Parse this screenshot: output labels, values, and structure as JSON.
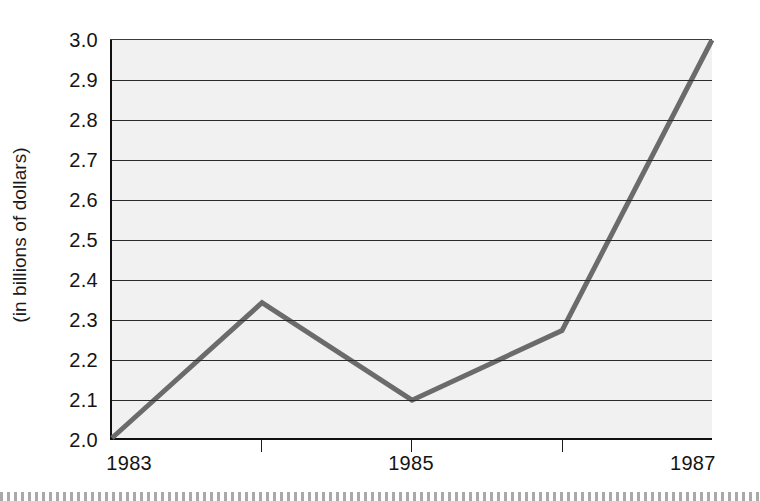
{
  "chart_data": {
    "type": "line",
    "title": "",
    "subtitle": "",
    "xlabel": "",
    "ylabel": "(in billions of dollars)",
    "x": [
      1983,
      1984,
      1985,
      1986,
      1987
    ],
    "values": [
      2.0,
      2.34,
      2.095,
      2.27,
      3.0
    ],
    "series": [
      {
        "name": "",
        "values": [
          2.0,
          2.34,
          2.095,
          2.27,
          3.0
        ]
      }
    ],
    "xlim": [
      1983,
      1987
    ],
    "ylim": [
      2.0,
      3.0
    ],
    "y_ticks": [
      "3.0",
      "2.9",
      "2.8",
      "2.7",
      "2.6",
      "2.5",
      "2.4",
      "2.3",
      "2.2",
      "2.1",
      "2.0"
    ],
    "y_tick_values": [
      3.0,
      2.9,
      2.8,
      2.7,
      2.6,
      2.5,
      2.4,
      2.3,
      2.2,
      2.1,
      2.0
    ],
    "x_ticks": [
      {
        "value": 1983,
        "label": "1983"
      },
      {
        "value": 1984,
        "label": ""
      },
      {
        "value": 1985,
        "label": "1985"
      },
      {
        "value": 1986,
        "label": ""
      },
      {
        "value": 1987,
        "label": "1987"
      }
    ],
    "grid": true,
    "grid_axis": "y",
    "legend": false,
    "legend_position": "none",
    "colors": {
      "line": "#6b6b6b",
      "plot_background": "#f1f1f1",
      "gridline": "#2b2b2b",
      "axis": "#101010",
      "text": "#141414",
      "page_background": "#ffffff"
    },
    "line_width": 5
  }
}
